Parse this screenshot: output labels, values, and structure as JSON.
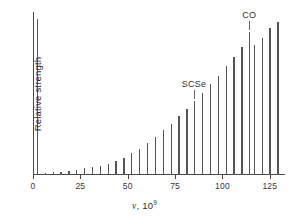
{
  "chart_data": {
    "type": "bar",
    "title": "",
    "subtitle": "",
    "xlabel_var": "ν",
    "xlabel_sep": ", 10",
    "xlabel_exp": "9",
    "ylabel": "Relative strength",
    "xlim": [
      0,
      133
    ],
    "ylim": [
      0,
      100
    ],
    "xticks": [
      0,
      25,
      50,
      75,
      100,
      125
    ],
    "xtick_labels": [
      "0",
      "25",
      "50",
      "75",
      "100",
      "125"
    ],
    "yticks": [],
    "ytick_labels": [],
    "grid": false,
    "legend": null,
    "x": [
      2.0,
      6.2,
      10.3,
      14.5,
      18.6,
      22.8,
      26.9,
      31.1,
      35.2,
      39.4,
      43.5,
      47.7,
      51.8,
      56.0,
      60.1,
      64.3,
      68.4,
      72.6,
      76.7,
      80.9,
      85.0,
      89.2,
      93.3,
      97.5,
      101.6,
      105.8,
      109.9,
      114.1,
      116.5,
      120.6,
      124.8,
      128.9
    ],
    "values": [
      96.0,
      1.2,
      1.6,
      2.0,
      2.6,
      3.2,
      4.0,
      4.8,
      5.8,
      7.0,
      8.6,
      10.6,
      13.2,
      16.2,
      19.6,
      23.4,
      27.4,
      31.6,
      36.0,
      40.6,
      45.4,
      50.4,
      55.6,
      61.0,
      66.6,
      72.4,
      78.4,
      88.0,
      80.0,
      84.0,
      90.0,
      94.0
    ],
    "annotations": [
      {
        "label": "SCSe",
        "x": 85.0,
        "y": 45.4,
        "label_y_offset": 22,
        "leader": true
      },
      {
        "label": "CO",
        "x": 114.1,
        "y": 88.0,
        "label_y_offset": 22,
        "leader": true
      }
    ]
  }
}
